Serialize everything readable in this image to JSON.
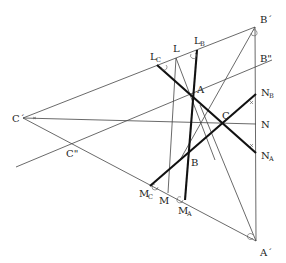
{
  "diagram": {
    "type": "geometry-construction",
    "points": {
      "A": {
        "label": "A",
        "x": 193,
        "y": 96
      },
      "B": {
        "label": "B",
        "x": 189,
        "y": 153
      },
      "C": {
        "label": "C",
        "x": 223,
        "y": 124
      },
      "A_prime": {
        "label": "A´",
        "x": 256,
        "y": 241
      },
      "B_prime": {
        "label": "B´",
        "x": 255,
        "y": 27
      },
      "C_prime": {
        "label": "C´",
        "x": 23,
        "y": 118
      },
      "B_dprime": {
        "label": "B\"",
        "x": 256,
        "y": 66
      },
      "C_dprime": {
        "label": "C\"",
        "x": 71,
        "y": 144
      },
      "L": {
        "label": "L",
        "x": 176,
        "y": 58
      },
      "L_B": {
        "label": "L",
        "sub": "B",
        "x": 197,
        "y": 50
      },
      "L_C": {
        "label": "L",
        "sub": "C",
        "x": 157,
        "y": 65
      },
      "M": {
        "label": "M",
        "x": 168,
        "y": 193
      },
      "M_A": {
        "label": "M",
        "sub": "A",
        "x": 185,
        "y": 200
      },
      "M_C": {
        "label": "M",
        "sub": "C",
        "x": 150,
        "y": 186
      },
      "N": {
        "label": "N",
        "x": 256,
        "y": 124
      },
      "N_A": {
        "label": "N",
        "sub": "A",
        "x": 256,
        "y": 153
      },
      "N_B": {
        "label": "N",
        "sub": "B",
        "x": 256,
        "y": 94
      }
    },
    "labels": {
      "A": "A",
      "B": "B",
      "C": "C",
      "A_prime": "A´",
      "B_prime": "B´",
      "C_prime": "C´",
      "B_dprime": "B\"",
      "C_dprime": "C\"",
      "L": "L",
      "L_main": "L",
      "L_sub_B": "B",
      "L_sub_C": "C",
      "M": "M",
      "M_main": "M",
      "M_sub_A": "A",
      "M_sub_C": "C",
      "N": "N",
      "N_main": "N",
      "N_sub_A": "A",
      "N_sub_B": "B"
    },
    "colors": {
      "line": "#444444",
      "thick": "#111111",
      "background": "#ffffff"
    }
  }
}
